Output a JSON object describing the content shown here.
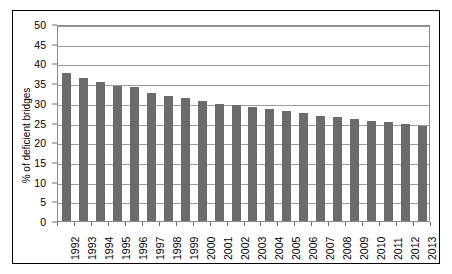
{
  "chart_data": {
    "type": "bar",
    "title": "",
    "subtitle": "",
    "xlabel": "",
    "ylabel": "% of deficient bridges",
    "ylim": [
      0,
      50
    ],
    "y_ticks": [
      0,
      5,
      10,
      15,
      20,
      25,
      30,
      35,
      40,
      45,
      50
    ],
    "y_tick_labels": [
      "0",
      "5",
      "10",
      "15",
      "20",
      "25",
      "30",
      "35",
      "40",
      "45",
      "50"
    ],
    "grid": "horizontal",
    "legend": "none",
    "bar_color": "#6b6b6b",
    "categories": [
      "1992",
      "1993",
      "1994",
      "1995",
      "1996",
      "1997",
      "1998",
      "1999",
      "2000",
      "2001",
      "2002",
      "2003",
      "2004",
      "2005",
      "2006",
      "2007",
      "2008",
      "2009",
      "2010",
      "2011",
      "2012",
      "2013"
    ],
    "values": [
      37.6,
      36.2,
      35.2,
      34.3,
      34.1,
      32.5,
      31.8,
      31.1,
      30.5,
      29.8,
      29.4,
      28.9,
      28.4,
      27.9,
      27.3,
      26.7,
      26.4,
      25.8,
      25.3,
      25.1,
      24.6,
      24.2
    ],
    "series": [
      {
        "name": "% of deficient bridges",
        "values": [
          37.6,
          36.2,
          35.2,
          34.3,
          34.1,
          32.5,
          31.8,
          31.1,
          30.5,
          29.8,
          29.4,
          28.9,
          28.4,
          27.9,
          27.3,
          26.7,
          26.4,
          25.8,
          25.3,
          25.1,
          24.6,
          24.2
        ]
      }
    ]
  }
}
